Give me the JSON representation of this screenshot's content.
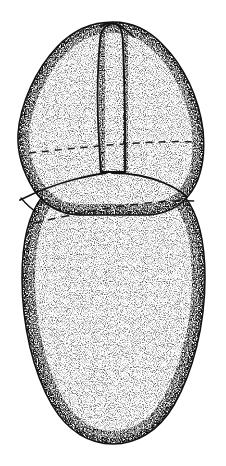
{
  "figure": {
    "domain": "natural-image",
    "kind": "scientific-line-drawing",
    "technique": "ink stipple shading with solid and dashed contour lines",
    "canvas": {
      "width": 226,
      "height": 466,
      "background": "#ffffff"
    },
    "colors": {
      "ink": "#111111",
      "hidden_line_ink": "#1a1a1a",
      "stipple": "#3a3a3a",
      "paper": "#ffffff"
    },
    "parts": [
      {
        "id": "upper-lobe",
        "label": "upper hood",
        "bbox": [
          18,
          22,
          203,
          215
        ],
        "description": "ovoid apical structure, widest near mid-height"
      },
      {
        "id": "median-keel",
        "label": "median keel",
        "bbox": [
          98,
          24,
          132,
          174
        ],
        "description": "narrow vertical ridge formed by two near-parallel curves running from apex notch to the transverse junction"
      },
      {
        "id": "lower-body",
        "label": "lower body",
        "bbox": [
          22,
          168,
          205,
          444
        ],
        "description": "large elongate ellipse forming the main body, rounded at the base"
      }
    ],
    "contours": {
      "solid": [
        {
          "id": "left-transverse",
          "from": [
            20,
            200
          ],
          "to": [
            107,
            173
          ]
        },
        {
          "id": "right-transverse",
          "from": [
            112,
            173
          ],
          "to": [
            186,
            196
          ]
        }
      ],
      "dashed": [
        {
          "id": "upper-hidden-margin",
          "from": [
            29,
            153
          ],
          "to": [
            197,
            142
          ],
          "dash": "7 6"
        },
        {
          "id": "lower-hidden-margin",
          "from": [
            34,
            223
          ],
          "to": [
            196,
            201
          ],
          "dash": "8 6"
        }
      ]
    },
    "stipple": {
      "style": "uniform fine stipple, density increasing toward the outlines",
      "interior_density": "light",
      "edge_density": "heavy"
    }
  }
}
